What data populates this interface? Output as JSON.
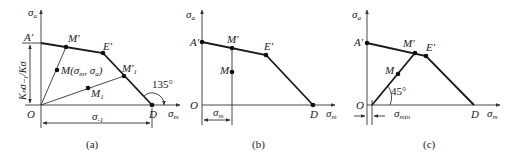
{
  "panels": [
    {
      "caption": "(a)",
      "y_axis_label": "σ",
      "y_axis_sub": "a",
      "x_axis_label": "σ",
      "x_axis_sub": "m",
      "origin_label": "O",
      "points": {
        "A": "A′",
        "M_prime": "M′",
        "E": "E′",
        "M1_prime": "M′",
        "M1_prime_sub": "1",
        "D": "D",
        "M": "M(σ",
        "M_sub_m": "m",
        "M_mid": ", σ",
        "M_sub_a": "a",
        "M_end": ")",
        "M1": "M",
        "M1_sub": "1"
      },
      "angle_label": "135°",
      "vertical_dimension": "Kₙσ₋₁/Kσ",
      "horizontal_dimension": "σ",
      "horizontal_dimension_sub": "-1"
    },
    {
      "caption": "(b)",
      "y_axis_label": "σ",
      "y_axis_sub": "a",
      "x_axis_label": "σ",
      "x_axis_sub": "m",
      "origin_label": "O",
      "points": {
        "A": "A′",
        "M_prime": "M′",
        "E": "E′",
        "M": "M",
        "D": "D"
      },
      "horizontal_dimension": "σ",
      "horizontal_dimension_sub": "m"
    },
    {
      "caption": "(c)",
      "y_axis_label": "σ",
      "y_axis_sub": "a",
      "x_axis_label": "σ",
      "x_axis_sub": "m",
      "origin_label": "O",
      "points": {
        "A": "A′",
        "M_prime": "M′",
        "E": "E′",
        "M": "M",
        "D": "D"
      },
      "angle_label": "45°",
      "horizontal_dimension": "σ",
      "horizontal_dimension_sub": "min"
    }
  ]
}
